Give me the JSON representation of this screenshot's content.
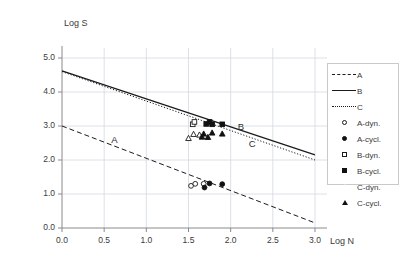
{
  "chart_data": {
    "type": "scatter",
    "title": "",
    "xlabel": "Log N",
    "ylabel": "Log S",
    "xlim": [
      0.0,
      3.0
    ],
    "ylim": [
      0.0,
      5.0
    ],
    "xticks": [
      "0.0",
      "0.5",
      "1.0",
      "1.5",
      "2.0",
      "2.5",
      "3.0"
    ],
    "yticks": [
      "0.0",
      "1.0",
      "2.0",
      "3.0",
      "4.0",
      "5.0"
    ],
    "grid": true,
    "legend_position": "right",
    "curve_labels": [
      {
        "text": "A",
        "x": 0.62,
        "y": 2.55
      },
      {
        "text": "B",
        "x": 2.12,
        "y": 2.93
      },
      {
        "text": "C",
        "x": 2.25,
        "y": 2.45
      }
    ],
    "series": [
      {
        "name": "A",
        "kind": "line",
        "style": "dashed",
        "color": "#1a1a1a",
        "x": [
          0.0,
          3.0
        ],
        "y": [
          3.0,
          0.15
        ]
      },
      {
        "name": "B",
        "kind": "line",
        "style": "solid",
        "color": "#1a1a1a",
        "x": [
          0.0,
          3.0
        ],
        "y": [
          4.62,
          2.15
        ]
      },
      {
        "name": "C",
        "kind": "line",
        "style": "dotted",
        "color": "#1a1a1a",
        "x": [
          0.0,
          3.0
        ],
        "y": [
          4.6,
          2.0
        ]
      },
      {
        "name": "A-dyn.",
        "kind": "markers",
        "marker": "circle-open",
        "color": "#1a1a1a",
        "points": [
          {
            "x": 1.53,
            "y": 1.24
          },
          {
            "x": 1.58,
            "y": 1.3
          },
          {
            "x": 1.68,
            "y": 1.3
          }
        ]
      },
      {
        "name": "A-cycl.",
        "kind": "markers",
        "marker": "circle-fill",
        "color": "#111111",
        "points": [
          {
            "x": 1.69,
            "y": 1.19
          },
          {
            "x": 1.75,
            "y": 1.31
          },
          {
            "x": 1.9,
            "y": 1.29
          }
        ]
      },
      {
        "name": "B-dyn.",
        "kind": "markers",
        "marker": "square-open",
        "color": "#1a1a1a",
        "points": [
          {
            "x": 1.55,
            "y": 3.05
          },
          {
            "x": 1.57,
            "y": 3.12
          }
        ]
      },
      {
        "name": "B-cycl.",
        "kind": "markers",
        "marker": "square-fill",
        "color": "#111111",
        "points": [
          {
            "x": 1.71,
            "y": 3.06
          },
          {
            "x": 1.75,
            "y": 3.12
          },
          {
            "x": 1.78,
            "y": 3.05
          },
          {
            "x": 1.9,
            "y": 3.05
          }
        ]
      },
      {
        "name": "C-dyn.",
        "kind": "markers",
        "marker": "triangle-open",
        "color": "#1a1a1a",
        "points": [
          {
            "x": 1.5,
            "y": 2.64
          },
          {
            "x": 1.56,
            "y": 2.76
          },
          {
            "x": 1.63,
            "y": 2.74
          }
        ]
      },
      {
        "name": "C-cycl.",
        "kind": "markers",
        "marker": "triangle-fill",
        "color": "#111111",
        "points": [
          {
            "x": 1.66,
            "y": 2.68
          },
          {
            "x": 1.68,
            "y": 2.77
          },
          {
            "x": 1.73,
            "y": 2.67
          },
          {
            "x": 1.78,
            "y": 2.8
          },
          {
            "x": 1.9,
            "y": 2.77
          }
        ]
      }
    ]
  },
  "axes": {
    "y_title": "Log S",
    "x_title": "Log N"
  },
  "legend": {
    "items": [
      {
        "label": "A",
        "key": "line-dashed"
      },
      {
        "label": "B",
        "key": "line-solid"
      },
      {
        "label": "C",
        "key": "line-dotted"
      },
      {
        "label": "A-dyn.",
        "key": "circle-open"
      },
      {
        "label": "A-cycl.",
        "key": "circle-fill"
      },
      {
        "label": "B-dyn.",
        "key": "square-open"
      },
      {
        "label": "B-cycl.",
        "key": "square-fill"
      },
      {
        "label": "C-dyn.",
        "key": "triangle-open"
      },
      {
        "label": "C-cycl.",
        "key": "triangle-fill"
      }
    ]
  }
}
